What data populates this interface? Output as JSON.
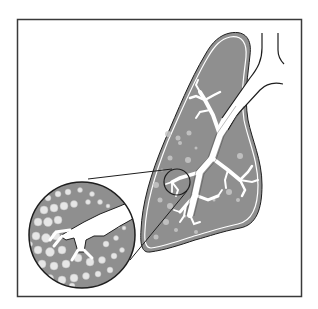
{
  "figure": {
    "title": "",
    "colors": {
      "background": "#ffffff",
      "frame": "#3a3a3a",
      "lung_fill": "#8f8f8f",
      "outline": "#1e1e1e",
      "airway": "#ffffff",
      "alveoli": "#dcdcdc"
    },
    "parts": [
      {
        "id": "lung",
        "label": ""
      },
      {
        "id": "trachea",
        "label": ""
      },
      {
        "id": "bronchial-tree",
        "label": ""
      },
      {
        "id": "focus-circle",
        "label": ""
      },
      {
        "id": "magnified-inset",
        "label": ""
      }
    ]
  }
}
